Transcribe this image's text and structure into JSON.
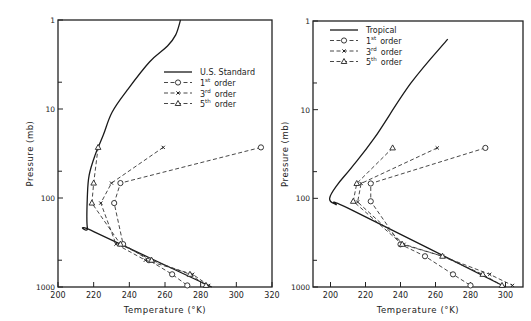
{
  "chart_data": [
    {
      "type": "line",
      "panel": "left",
      "title": "",
      "xlabel": "Temperature (°K)",
      "ylabel": "Pressure (mb)",
      "xlim": [
        200,
        320
      ],
      "ylim": [
        1000,
        1
      ],
      "yscale": "log",
      "xticks": [
        200,
        220,
        240,
        260,
        280,
        300,
        320
      ],
      "xtick_labels": [
        "200",
        "220",
        "240",
        "260",
        "280",
        "300",
        "320"
      ],
      "yticks": [
        1,
        10,
        100,
        1000
      ],
      "ytick_labels": [
        "1",
        "10",
        "100",
        "1000"
      ],
      "yminor_ticks": [
        5,
        50,
        500
      ],
      "grid": false,
      "legend_position": "upper right",
      "legend": [
        {
          "label": "U.S. Standard",
          "style": "solid",
          "marker": "none"
        },
        {
          "label_num": "1",
          "label_sup": "st",
          "label_rest": "order",
          "style": "dashed",
          "marker": "circle"
        },
        {
          "label_num": "3",
          "label_sup": "rd",
          "label_rest": "order",
          "style": "dashed",
          "marker": "x"
        },
        {
          "label_num": "5",
          "label_sup": "th",
          "label_rest": "order",
          "style": "dashed",
          "marker": "triangle"
        }
      ],
      "series": [
        {
          "name": "U.S. Standard",
          "style": "solid",
          "marker": "none",
          "points": [
            [
              268.7,
              1
            ],
            [
              266,
              1.47
            ],
            [
              261.4,
              1.96
            ],
            [
              251.3,
              2.96
            ],
            [
              238.9,
              6.1
            ],
            [
              230.4,
              10.8
            ],
            [
              225.4,
              19.6
            ],
            [
              220.8,
              33
            ],
            [
              217.5,
              55
            ],
            [
              216.5,
              92
            ],
            [
              216.5,
              218
            ],
            [
              220.3,
              240
            ],
            [
              286.2,
              1000
            ]
          ]
        },
        {
          "name": "1st order",
          "style": "dashed",
          "marker": "circle",
          "points": [
            [
              313.8,
              27
            ],
            [
              235,
              68
            ],
            [
              231.5,
              114
            ],
            [
              236.5,
              330
            ],
            [
              251,
              500
            ],
            [
              264,
              720
            ],
            [
              272.5,
              960
            ]
          ]
        },
        {
          "name": "3rd order",
          "style": "dashed",
          "marker": "x",
          "points": [
            [
              259,
              27
            ],
            [
              230,
              68
            ],
            [
              224,
              114
            ],
            [
              232.5,
              330
            ],
            [
              249,
              500
            ],
            [
              275.5,
              720
            ],
            [
              284.5,
              960
            ]
          ]
        },
        {
          "name": "5th order",
          "style": "dashed",
          "marker": "triangle",
          "points": [
            [
              222.5,
              27
            ],
            [
              220,
              68
            ],
            [
              219,
              114
            ],
            [
              235,
              330
            ],
            [
              252.5,
              500
            ],
            [
              274,
              720
            ],
            [
              283,
              960
            ]
          ]
        }
      ]
    },
    {
      "type": "line",
      "panel": "right",
      "title": "",
      "xlabel": "Temperature (°K)",
      "ylabel": "Pressure (mb)",
      "xlim": [
        190,
        310
      ],
      "ylim": [
        1000,
        1
      ],
      "yscale": "log",
      "xticks": [
        200,
        220,
        240,
        260,
        280,
        300
      ],
      "xtick_labels": [
        "200",
        "220",
        "240",
        "260",
        "280",
        "300"
      ],
      "yticks": [
        1,
        10,
        100,
        1000
      ],
      "ytick_labels": [
        "1",
        "10",
        "100",
        "1000"
      ],
      "yminor_ticks": [
        5,
        50,
        500
      ],
      "grid": false,
      "legend_position": "upper left",
      "legend": [
        {
          "label": "Tropical",
          "style": "solid",
          "marker": "none"
        },
        {
          "label_num": "1",
          "label_sup": "st",
          "label_rest": "order",
          "style": "dashed",
          "marker": "circle"
        },
        {
          "label_num": "3",
          "label_sup": "rd",
          "label_rest": "order",
          "style": "dashed",
          "marker": "x"
        },
        {
          "label_num": "5",
          "label_sup": "th",
          "label_rest": "order",
          "style": "dashed",
          "marker": "triangle"
        }
      ],
      "series": [
        {
          "name": "Tropical",
          "style": "solid",
          "marker": "none",
          "points": [
            [
              267,
              1.6
            ],
            [
              246,
              5
            ],
            [
              225,
              21
            ],
            [
              212,
              45
            ],
            [
              204,
              70
            ],
            [
              199.5,
              100
            ],
            [
              203,
              117
            ],
            [
              212,
              135
            ],
            [
              300,
              1000
            ]
          ]
        },
        {
          "name": "1st order",
          "style": "dashed",
          "marker": "circle",
          "points": [
            [
              288.5,
              27
            ],
            [
              223,
              68
            ],
            [
              223,
              108
            ],
            [
              240,
              330
            ],
            [
              254,
              450
            ],
            [
              270,
              720
            ],
            [
              280,
              960
            ]
          ]
        },
        {
          "name": "3rd order",
          "style": "dashed",
          "marker": "x",
          "points": [
            [
              261,
              27
            ],
            [
              217.5,
              68
            ],
            [
              215.5,
              110
            ],
            [
              242,
              330
            ],
            [
              264,
              450
            ],
            [
              291,
              720
            ],
            [
              304,
              960
            ]
          ]
        },
        {
          "name": "5th order",
          "style": "dashed",
          "marker": "triangle",
          "points": [
            [
              235.5,
              27
            ],
            [
              215,
              68
            ],
            [
              213,
              108
            ],
            [
              241,
              330
            ],
            [
              264,
              450
            ],
            [
              287,
              720
            ],
            [
              298,
              960
            ]
          ]
        }
      ]
    }
  ],
  "layout": {
    "panels": [
      {
        "x0": 58,
        "x1": 272,
        "y0": 20,
        "y1": 287
      },
      {
        "x0": 313,
        "x1": 523,
        "y0": 21,
        "y1": 287
      }
    ],
    "legend_anchor": [
      {
        "x": 164,
        "y": 72
      },
      {
        "x": 330,
        "y": 30
      }
    ]
  }
}
